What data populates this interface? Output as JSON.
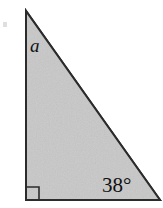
{
  "figure": {
    "kind": "right-triangle-diagram",
    "canvas": {
      "width": 163,
      "height": 208,
      "background_color": "#ffffff"
    },
    "shape": {
      "name": "right-triangle",
      "fill_color": "#c9c9c9",
      "stroke_color": "#2b2b2b",
      "stroke_width": 2,
      "vertices": [
        {
          "name": "apex-top-left",
          "x": 26,
          "y": 11
        },
        {
          "name": "right-angle-bottom-left",
          "x": 26,
          "y": 200
        },
        {
          "name": "angle-38-bottom-right",
          "x": 160,
          "y": 200
        }
      ]
    },
    "right_angle_marker": {
      "name": "right-angle-square",
      "x": 27,
      "y": 187,
      "size": 12,
      "stroke_color": "#2b2b2b",
      "stroke_width": 1.6
    },
    "labels": {
      "side_a": {
        "text": "a",
        "style": "italic-serif",
        "color": "#111111",
        "x": 30,
        "y": 36
      },
      "angle_b": {
        "text": "38°",
        "value": 38,
        "unit": "degrees",
        "style": "serif",
        "color": "#111111",
        "x": 102,
        "y": 175
      }
    },
    "artifacts": [
      {
        "name": "scan-speck",
        "x": 3,
        "y": 22,
        "width": 4,
        "height": 5,
        "color": "#d9d9d9"
      }
    ]
  }
}
